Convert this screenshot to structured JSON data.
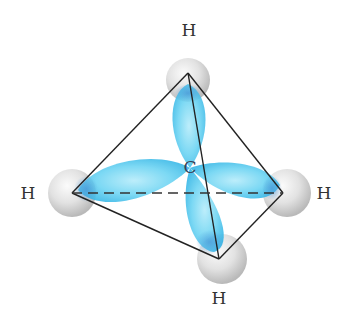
{
  "diagram": {
    "central_atom": {
      "label": "C",
      "x": 190,
      "y": 167
    },
    "hydrogens": [
      {
        "id": "top",
        "label": "H",
        "x": 188,
        "y": 73,
        "label_x": 189,
        "label_y": 36
      },
      {
        "id": "left",
        "label": "H",
        "x": 72,
        "y": 193,
        "label_x": 28,
        "label_y": 199
      },
      {
        "id": "right",
        "label": "H",
        "x": 283,
        "y": 193,
        "label_x": 324,
        "label_y": 199
      },
      {
        "id": "bottom",
        "label": "H",
        "x": 219,
        "y": 259,
        "label_x": 219,
        "label_y": 304
      }
    ],
    "colors": {
      "orbital": "#5fd0f0",
      "orbital_dark": "#3aa9e0",
      "sphere": "#d9d9d9",
      "edge": "#222222",
      "background": "#ffffff"
    },
    "edges": {
      "solid": [
        "top-left",
        "top-right",
        "top-bottom",
        "left-bottom",
        "right-bottom"
      ],
      "dashed": [
        "left-right"
      ]
    }
  }
}
